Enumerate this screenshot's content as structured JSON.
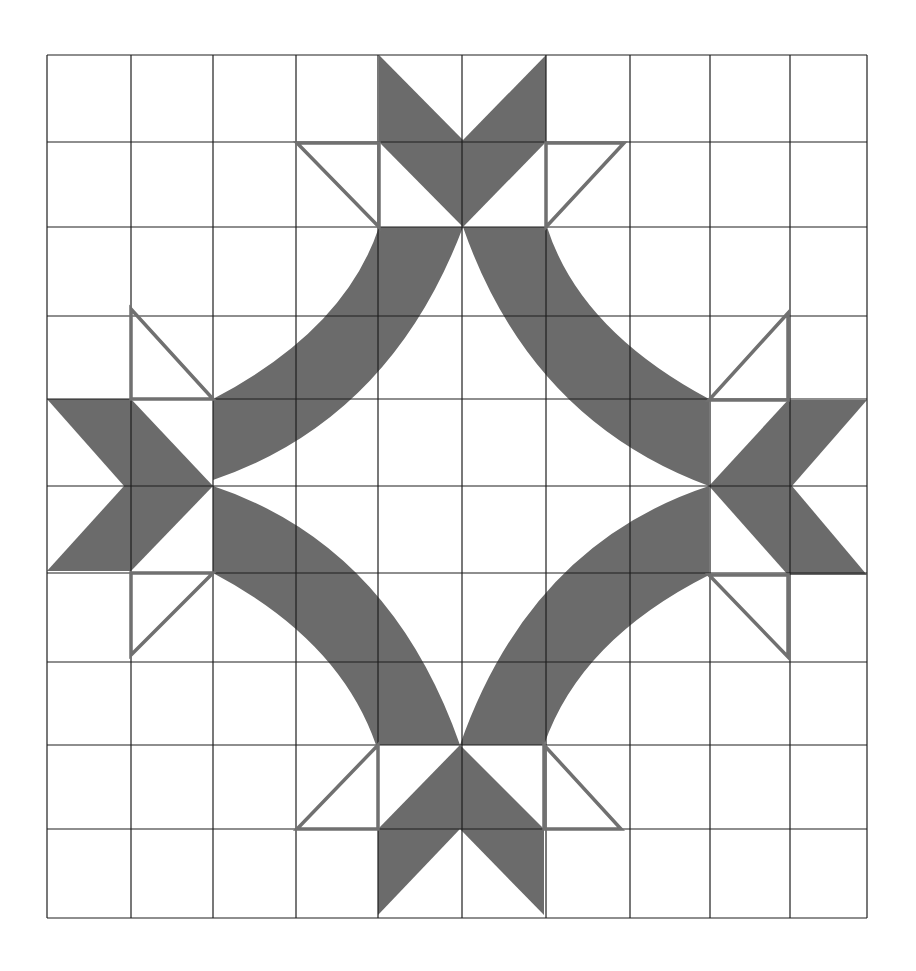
{
  "diagram": {
    "type": "quilt-block",
    "colors": {
      "background": "#ffffff",
      "grid": "#1e1e1e",
      "fill": "#6b6b6b",
      "outline": "#707070"
    },
    "grid": {
      "columns": 10,
      "rows": 10,
      "x_lines": [
        47,
        131,
        213,
        296,
        378,
        462,
        546,
        630,
        710,
        790,
        867
      ],
      "y_lines": [
        55,
        142,
        227,
        316,
        399,
        486,
        573,
        662,
        745,
        829,
        918
      ]
    },
    "stars": [
      {
        "name": "top-star",
        "blades": [
          "379,55 379,142 463,227 463,140",
          "546,55 546,142 463,227 463,140"
        ],
        "triangles": [
          "297,143 379,143 379,227",
          "546,143 624,143 546,227"
        ]
      },
      {
        "name": "left-star",
        "blades": [
          "47,399 131,399 213,486 124,486",
          "124,486 213,486 131,571 47,571"
        ],
        "triangles": [
          "131,309 131,399 213,399",
          "131,573 213,573 131,655"
        ]
      },
      {
        "name": "right-star",
        "blades": [
          "709,486 788,400 867,400 792,486",
          "709,486 792,486 867,575 788,575"
        ],
        "triangles": [
          "788,313 788,400 709,400",
          "709,575 788,575 788,657"
        ]
      },
      {
        "name": "bottom-star",
        "blades": [
          "460,745 460,829 378,915 378,829",
          "460,745 544,829 544,915 460,829"
        ],
        "triangles": [
          "378,745 378,829 297,829",
          "544,745 544,829 621,829"
        ]
      }
    ],
    "arcs": [
      {
        "name": "arc-upper-left",
        "path": "M 213 399 Q 345 330 379 227 L 463 227 Q 390 420 213 480 Z"
      },
      {
        "name": "arc-upper-right",
        "path": "M 463 227 L 547 227 Q 580 330 709 399 L 709 486 Q 530 420 463 227 Z"
      },
      {
        "name": "arc-lower-left",
        "path": "M 213 486 Q 390 545 460 745 L 376 745 Q 340 640 213 573 Z"
      },
      {
        "name": "arc-lower-right",
        "path": "M 709 486 L 709 575 Q 580 640 544 745 L 460 745 Q 530 545 709 486 Z"
      }
    ]
  }
}
